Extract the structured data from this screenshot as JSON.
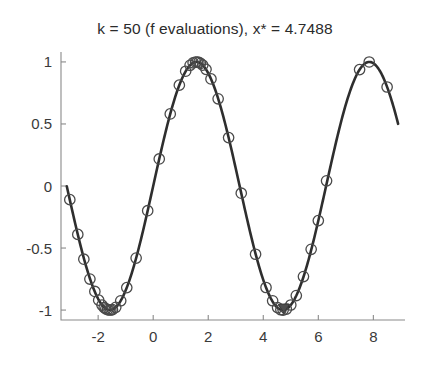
{
  "chart_data": {
    "type": "line",
    "title": "k = 50 (f evaluations), x* = 4.7488",
    "xlabel": "",
    "ylabel": "",
    "xlim": [
      -3.35,
      9.15
    ],
    "ylim": [
      -1.08,
      1.08
    ],
    "xticks": [
      -2,
      0,
      2,
      4,
      6,
      8
    ],
    "xticklabels": [
      "-2",
      "0",
      "2",
      "4",
      "6",
      "8"
    ],
    "yticks": [
      -1,
      -0.5,
      0,
      0.5,
      1
    ],
    "yticklabels": [
      "-1",
      "-0.5",
      "0",
      "0.5",
      "1"
    ],
    "grid": false,
    "legend": null,
    "function": "y = sin(x)",
    "series": [
      {
        "name": "objective function",
        "kind": "line",
        "x_start": -3.14,
        "x_end": 8.9,
        "samples": 400
      },
      {
        "name": "f evaluations",
        "kind": "scatter",
        "marker": "circle-open",
        "count": 50,
        "x": [
          -3.03,
          -2.74,
          -2.52,
          -2.3,
          -2.12,
          -1.98,
          -1.86,
          -1.78,
          -1.72,
          -1.66,
          -1.6,
          -1.54,
          -1.48,
          -1.36,
          -1.18,
          -0.96,
          -0.62,
          -0.2,
          0.22,
          0.62,
          0.95,
          1.18,
          1.34,
          1.45,
          1.54,
          1.6,
          1.66,
          1.72,
          1.8,
          1.92,
          2.1,
          2.36,
          2.74,
          3.2,
          3.72,
          4.1,
          4.34,
          4.52,
          4.64,
          4.72,
          4.84,
          5.0,
          5.2,
          5.46,
          5.74,
          6.0,
          6.3,
          7.5,
          7.85,
          8.5
        ],
        "y": [
          -0.11,
          -0.39,
          -0.59,
          -0.75,
          -0.85,
          -0.92,
          -0.96,
          -0.98,
          -0.99,
          -0.996,
          -0.9996,
          -0.9995,
          -0.996,
          -0.978,
          -0.925,
          -0.819,
          -0.581,
          -0.199,
          0.218,
          0.581,
          0.813,
          0.925,
          0.973,
          0.993,
          0.9995,
          0.9996,
          0.996,
          0.989,
          0.974,
          0.94,
          0.863,
          0.703,
          0.39,
          -0.058,
          -0.55,
          -0.818,
          -0.925,
          -0.98,
          -0.9975,
          -0.9999,
          -0.9924,
          -0.959,
          -0.883,
          -0.73,
          -0.51,
          -0.279,
          0.042,
          0.938,
          0.9996,
          0.798
        ]
      },
      {
        "name": "found optimum",
        "kind": "scatter",
        "marker": "triangle-filled",
        "x": [
          4.7488
        ],
        "y": [
          -1.0
        ]
      }
    ],
    "annotations": [
      {
        "label": "x*",
        "value": 4.7488
      },
      {
        "label": "k",
        "value": 50
      }
    ],
    "colors": {
      "curve": "#2e2e2e",
      "marker_edge": "#4a4a4a",
      "optimum": "#4d4d4d",
      "axis": "#8a8a8a",
      "text": "#3a3a3a",
      "background": "#ffffff"
    }
  }
}
